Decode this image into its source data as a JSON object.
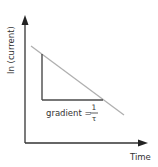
{
  "diagram": {
    "y_axis_label": "ln (current)",
    "x_axis_label": "Time",
    "gradient_label": "gradient =",
    "gradient_numerator": "1",
    "gradient_denominator": "τ",
    "colors": {
      "axis": "#333333",
      "decay_line": "#b0b0b0",
      "triangle": "#4a4a4a",
      "text": "#333333"
    }
  }
}
